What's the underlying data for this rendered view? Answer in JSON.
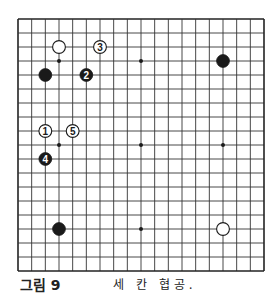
{
  "diagram": {
    "type": "go-board",
    "size": 19,
    "geometry": {
      "left": 18,
      "top": 19,
      "right": 264,
      "bottom": 271
    },
    "colors": {
      "line": "#333333",
      "border": "#222222",
      "black": "#1a1a1a",
      "white": "#ffffff",
      "background": "#ffffff"
    },
    "star_points": [
      {
        "col": 3,
        "row": 3
      },
      {
        "col": 9,
        "row": 3
      },
      {
        "col": 15,
        "row": 3
      },
      {
        "col": 3,
        "row": 9
      },
      {
        "col": 9,
        "row": 9
      },
      {
        "col": 15,
        "row": 9
      },
      {
        "col": 3,
        "row": 15
      },
      {
        "col": 9,
        "row": 15
      },
      {
        "col": 15,
        "row": 15
      }
    ],
    "stones": [
      {
        "color": "white",
        "col": 3,
        "row": 2,
        "label": ""
      },
      {
        "color": "white",
        "col": 6,
        "row": 2,
        "label": "3"
      },
      {
        "color": "black",
        "col": 2,
        "row": 4,
        "label": ""
      },
      {
        "color": "black",
        "col": 5,
        "row": 4,
        "label": "2"
      },
      {
        "color": "black",
        "col": 15,
        "row": 3,
        "label": ""
      },
      {
        "color": "white",
        "col": 2,
        "row": 8,
        "label": "1"
      },
      {
        "color": "white",
        "col": 4,
        "row": 8,
        "label": "5"
      },
      {
        "color": "black",
        "col": 2,
        "row": 10,
        "label": "4"
      },
      {
        "color": "black",
        "col": 3,
        "row": 15,
        "label": ""
      },
      {
        "color": "white",
        "col": 15,
        "row": 15,
        "label": ""
      }
    ]
  },
  "caption": {
    "label": "그림 9",
    "text": "세 칸 협공."
  }
}
